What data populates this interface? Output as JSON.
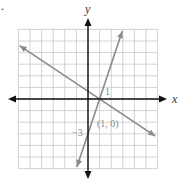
{
  "chart_data": {
    "type": "line",
    "title": "",
    "xlabel": "x",
    "ylabel": "y",
    "xlim": [
      -6,
      6
    ],
    "ylim": [
      -6,
      6
    ],
    "grid": true,
    "series": [
      {
        "name": "line-steep",
        "equation": "y = 3x - 3",
        "points": [
          [
            -0.95,
            -5.85
          ],
          [
            2.95,
            5.85
          ]
        ],
        "color": "#8a8a8a"
      },
      {
        "name": "line-shallow",
        "equation": "y = -2x/3 + 2/3",
        "points": [
          [
            -5.9,
            4.6
          ],
          [
            5.8,
            -3.2
          ]
        ],
        "color": "#8a8a8a"
      }
    ],
    "annotations": [
      {
        "text": "1",
        "x": 1.6,
        "y": 0.6
      },
      {
        "text": "(1, 0)",
        "x": 0.8,
        "y": -2.2
      },
      {
        "text": "−3",
        "x": -1.2,
        "y": -2.9
      }
    ]
  },
  "labels": {
    "x_axis": "x",
    "y_axis": "y",
    "intercept_one": "1",
    "point_label": "(1, 0)",
    "y_intercept": "−3",
    "corner_mark": "."
  },
  "colors": {
    "grid": "#c8c8c8",
    "axis": "#111111",
    "line": "#8a8a8a"
  }
}
